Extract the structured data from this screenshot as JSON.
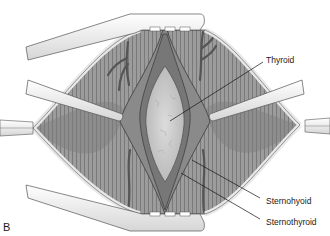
{
  "figure": {
    "panel_letter": "B",
    "colors": {
      "background": "#ffffff",
      "muscle": "#9a9a9a",
      "muscle_dark": "#6f6f6f",
      "thyroid": "#cfcfcf",
      "retractor": "#f2f2f2",
      "outline": "#4a4a4a",
      "vessel": "#5c5c5c",
      "skin_edge": "#e6e6e6"
    },
    "labels": [
      {
        "id": "thyroid",
        "text": "Thyroid",
        "x": 266,
        "y": 56
      },
      {
        "id": "sternohyoid",
        "text": "Sternohyoid",
        "x": 266,
        "y": 197
      },
      {
        "id": "sternothyroid",
        "text": "Sternothyroid",
        "x": 266,
        "y": 218
      }
    ]
  }
}
